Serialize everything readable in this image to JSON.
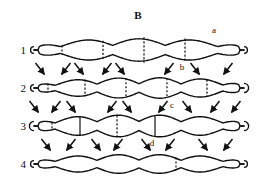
{
  "figure": {
    "panel_label": "B",
    "type": "diagram",
    "background_color": "#ffffff",
    "stroke_color": "#111111"
  },
  "rows": [
    {
      "number": "1",
      "y": 50,
      "amplitude": 13,
      "cycles": 4,
      "left_cap": "round",
      "right_cap": "round",
      "dividers": [
        62,
        103,
        144,
        185
      ],
      "divider_style": "dashed"
    },
    {
      "number": "2",
      "y": 88,
      "amplitude": 11,
      "cycles": 5,
      "left_cap": "round",
      "right_cap": "bulb",
      "dividers": [
        48,
        85,
        126,
        167,
        207
      ],
      "divider_style": "dashed"
    },
    {
      "number": "3",
      "y": 126,
      "amplitude": 11,
      "cycles": 5,
      "left_cap": "bulb",
      "right_cap": "bulb",
      "dividers": [
        52,
        80,
        117,
        155
      ],
      "divider_style": "mixed"
    },
    {
      "number": "4",
      "y": 164,
      "amplitude": 11,
      "cycles": 5,
      "left_cap": "round",
      "right_cap": "round",
      "dividers": [
        176
      ],
      "divider_style": "dashed"
    }
  ],
  "arrow_bands": [
    {
      "between": "1-2",
      "y": 69,
      "arrows": [
        {
          "x": 40,
          "dir": "down-right"
        },
        {
          "x": 66,
          "dir": "down-left"
        },
        {
          "x": 79,
          "dir": "down-right"
        },
        {
          "x": 107,
          "dir": "down-left"
        },
        {
          "x": 120,
          "dir": "down-right"
        },
        {
          "x": 169,
          "dir": "down-left"
        },
        {
          "x": 195,
          "dir": "down-right"
        },
        {
          "x": 228,
          "dir": "down-left"
        }
      ]
    },
    {
      "between": "2-3",
      "y": 107,
      "arrows": [
        {
          "x": 34,
          "dir": "down-right"
        },
        {
          "x": 56,
          "dir": "down-left"
        },
        {
          "x": 71,
          "dir": "down-right"
        },
        {
          "x": 112,
          "dir": "down-left"
        },
        {
          "x": 127,
          "dir": "down-right"
        },
        {
          "x": 163,
          "dir": "down-left"
        },
        {
          "x": 187,
          "dir": "down-right"
        },
        {
          "x": 215,
          "dir": "down-left"
        },
        {
          "x": 236,
          "dir": "down-left"
        }
      ]
    },
    {
      "between": "3-4",
      "y": 145,
      "arrows": [
        {
          "x": 46,
          "dir": "down-right"
        },
        {
          "x": 71,
          "dir": "down-left"
        },
        {
          "x": 96,
          "dir": "down-right"
        },
        {
          "x": 118,
          "dir": "down-left"
        },
        {
          "x": 146,
          "dir": "down-right"
        },
        {
          "x": 170,
          "dir": "down-left"
        },
        {
          "x": 203,
          "dir": "down-right"
        },
        {
          "x": 228,
          "dir": "down-left"
        }
      ]
    }
  ],
  "point_labels": [
    {
      "id": "a",
      "text": "a",
      "x": 214,
      "y": 30
    },
    {
      "id": "b",
      "text": "b",
      "x": 182,
      "y": 66
    },
    {
      "id": "c",
      "text": "c",
      "x": 172,
      "y": 104
    },
    {
      "id": "d",
      "text": "d",
      "x": 152,
      "y": 142
    }
  ]
}
